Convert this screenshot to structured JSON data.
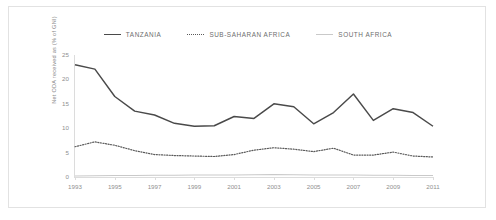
{
  "figure": {
    "background_color": "#ffffff",
    "border_color": "#e2e2e2"
  },
  "legend": {
    "position": "top-center",
    "entries": [
      {
        "label": "TANZANIA",
        "marker": "solid-line-dark",
        "color": "#4a4a4a"
      },
      {
        "label": "SUB-SAHARAN AFRICA",
        "marker": "dotted-line-dark",
        "color": "#5a5a5a"
      },
      {
        "label": "SOUTH AFRICA",
        "marker": "solid-line-light",
        "color": "#c9c9c9"
      }
    ]
  },
  "axes": {
    "y_title": "Net ODA received as (% of GNI)",
    "y_ticks": [
      "25",
      "20",
      "15",
      "10",
      "5",
      "0"
    ],
    "x_ticks": [
      "1993",
      "1995",
      "1997",
      "1999",
      "2001",
      "2003",
      "2005",
      "2007",
      "2009",
      "2011"
    ]
  },
  "chart_data": {
    "type": "line",
    "title": "",
    "subtitle": "",
    "xlabel": "",
    "ylabel": "Net ODA received as (% of GNI)",
    "xlim": [
      1993,
      2011
    ],
    "ylim": [
      0,
      25
    ],
    "grid": false,
    "legend_position": "top-center",
    "x": [
      1993,
      1994,
      1995,
      1996,
      1997,
      1998,
      1999,
      2000,
      2001,
      2002,
      2003,
      2004,
      2005,
      2006,
      2007,
      2008,
      2009,
      2010,
      2011
    ],
    "series": [
      {
        "name": "TANZANIA",
        "color": "#4a4a4a",
        "style": "solid",
        "values": [
          23.0,
          22.1,
          16.5,
          13.5,
          12.7,
          11.0,
          10.4,
          10.5,
          12.4,
          12.0,
          15.0,
          14.4,
          10.9,
          13.2,
          17.0,
          11.6,
          14.0,
          13.2,
          10.4
        ]
      },
      {
        "name": "SUB-SAHARAN AFRICA",
        "color": "#5a5a5a",
        "style": "dotted",
        "values": [
          6.2,
          7.2,
          6.5,
          5.4,
          4.6,
          4.4,
          4.3,
          4.2,
          4.6,
          5.5,
          6.0,
          5.7,
          5.2,
          5.9,
          4.5,
          4.5,
          5.1,
          4.3,
          4.1
        ]
      },
      {
        "name": "SOUTH AFRICA",
        "color": "#c9c9c9",
        "style": "solid",
        "values": [
          0.2,
          0.25,
          0.3,
          0.3,
          0.35,
          0.35,
          0.4,
          0.4,
          0.4,
          0.45,
          0.5,
          0.45,
          0.4,
          0.4,
          0.4,
          0.35,
          0.35,
          0.3,
          0.3
        ]
      }
    ]
  }
}
